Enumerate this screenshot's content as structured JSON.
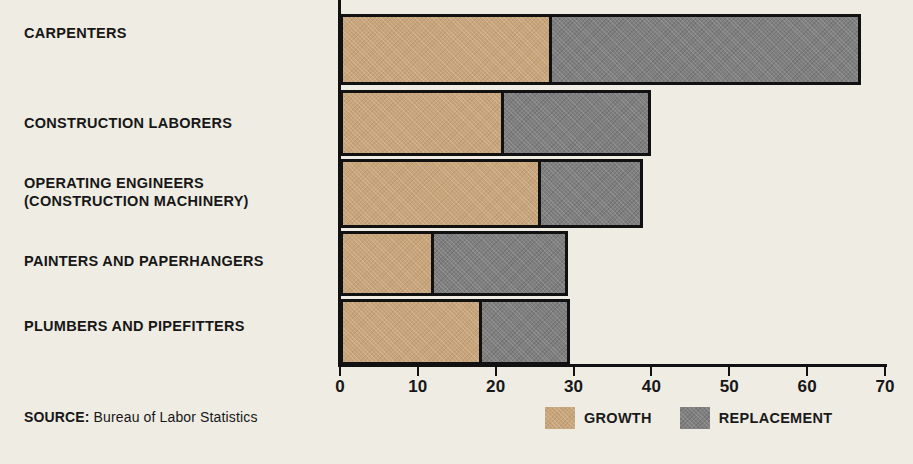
{
  "chart_data": {
    "type": "bar",
    "orientation": "horizontal",
    "stacked": true,
    "title": "",
    "xlabel": "",
    "ylabel": "",
    "xlim": [
      0,
      70
    ],
    "xticks": [
      0,
      10,
      20,
      30,
      40,
      50,
      60,
      70
    ],
    "xtick_labels": [
      "0",
      "10",
      "20",
      "30",
      "40",
      "50",
      "60",
      "70"
    ],
    "grid": false,
    "legend_position": "bottom-right",
    "categories": [
      "CARPENTERS",
      "CONSTRUCTION LABORERS",
      "OPERATING ENGINEERS\n(CONSTRUCTION MACHINERY)",
      "PAINTERS AND PAPERHANGERS",
      "PLUMBERS AND PIPEFITTERS"
    ],
    "series": [
      {
        "name": "GROWTH",
        "color": "#c8a47a",
        "values": [
          26.5,
          20.3,
          25.0,
          11.3,
          17.5
        ]
      },
      {
        "name": "REPLACEMENT",
        "color": "#7f7f7f",
        "values": [
          40.0,
          19.2,
          13.5,
          17.6,
          11.6
        ]
      }
    ],
    "totals": [
      66.5,
      39.5,
      38.5,
      28.9,
      29.1
    ]
  },
  "legend": {
    "items": [
      {
        "label": "GROWTH",
        "swatch": "growth-swatch"
      },
      {
        "label": "REPLACEMENT",
        "swatch": "replacement-swatch"
      }
    ]
  },
  "source": {
    "key": "SOURCE:",
    "value": "Bureau of Labor Statistics"
  },
  "colors": {
    "background": "#efece3",
    "growth": "#c8a47a",
    "replacement": "#7f7f7f",
    "axis": "#111111",
    "text": "#171717"
  }
}
